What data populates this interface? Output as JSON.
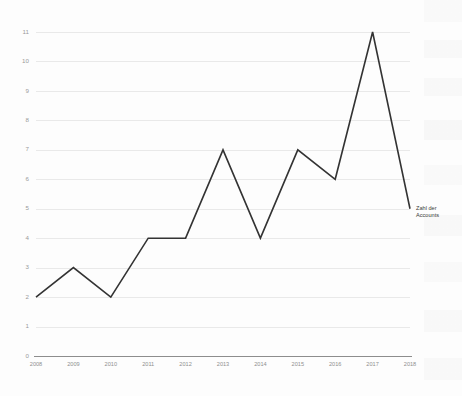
{
  "chart_data": {
    "type": "line",
    "title": "",
    "subtitle": "",
    "xlabel": "",
    "ylabel": "",
    "categories": [
      "2008",
      "2009",
      "2010",
      "2011",
      "2012",
      "2013",
      "2014",
      "2015",
      "2016",
      "2017",
      "2018"
    ],
    "series": [
      {
        "name": "Zahl der Accounts",
        "values": [
          2,
          3,
          2,
          4,
          4,
          7,
          4,
          7,
          6,
          11,
          5
        ]
      }
    ],
    "x": [
      2008,
      2009,
      2010,
      2011,
      2012,
      2013,
      2014,
      2015,
      2016,
      2017,
      2018
    ],
    "xlim": [
      2008,
      2018
    ],
    "ylim": [
      0,
      11
    ],
    "y_ticks": [
      0,
      1,
      2,
      3,
      4,
      5,
      6,
      7,
      8,
      9,
      10,
      11
    ],
    "y_tick_labels": [
      "0",
      "1",
      "2",
      "3",
      "4",
      "5",
      "6",
      "7",
      "8",
      "9",
      "10",
      "11"
    ],
    "grid": true,
    "grid_axis": "y",
    "legend_position": "right-of-endpoint",
    "annotations": [
      {
        "text_line_1": "Zahl der",
        "text_line_2": "Accounts",
        "anchor_year": 2018,
        "anchor_value": 5
      }
    ],
    "colors": {
      "series_line": "#333333",
      "gridline": "#e9e9e9",
      "axis": "#8d8d8d",
      "tick_label": "#8f8f8f",
      "background": "#fdfdfd",
      "annotation_text": "#3a3a3a"
    }
  }
}
